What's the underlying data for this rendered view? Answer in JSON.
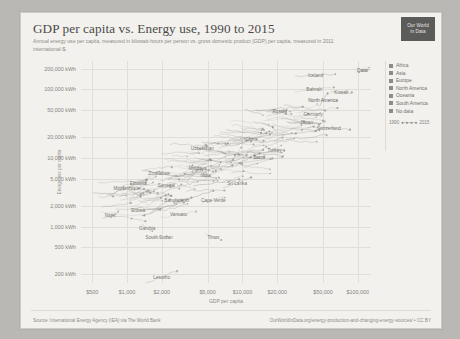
{
  "header": {
    "title": "GDP per capita vs. Energy use, 1990 to 2015",
    "subtitle": "Annual energy use per capita, measured in kilowatt-hours per person vs. gross domestic product (GDP) per capita, measured in 2011 international-$.",
    "logo_line1": "Our World",
    "logo_line2": "in Data"
  },
  "footer": {
    "source": "Source: International Energy Agency (IEA) via The World Bank",
    "link": "OurWorldInData.org/energy-production-and-changing-energy-sources/ • CC BY"
  },
  "legend": {
    "entries": [
      {
        "label": "Africa",
        "color": "#8c8c8a"
      },
      {
        "label": "Asia",
        "color": "#8c8c8a"
      },
      {
        "label": "Europe",
        "color": "#8c8c8a"
      },
      {
        "label": "North America",
        "color": "#8c8c8a"
      },
      {
        "label": "Oceania",
        "color": "#8c8c8a"
      },
      {
        "label": "South America",
        "color": "#8c8c8a"
      },
      {
        "label": "No data",
        "color": "#8c8c8a"
      }
    ],
    "timeline_start": "1990",
    "timeline_end": "2015",
    "timeline_dots": "●–●–●–●"
  },
  "chart_data": {
    "type": "scatter",
    "title": "GDP per capita vs. Energy use, 1990 to 2015",
    "subtitle": "Annual energy use per capita, measured in kilowatt-hours per person vs. gross domestic product (GDP) per capita, measured in 2011 international-$.",
    "xlabel": "GDP per capita",
    "ylabel": "Energy use per capita",
    "xscale": "log",
    "yscale": "log",
    "xlim": [
      400,
      130000
    ],
    "ylim": [
      150,
      260000
    ],
    "grid": true,
    "legend_position": "right",
    "xticks": [
      {
        "value": 500,
        "label": "$500"
      },
      {
        "value": 1000,
        "label": "$1,000"
      },
      {
        "value": 2000,
        "label": "$2,000"
      },
      {
        "value": 5000,
        "label": "$5,000"
      },
      {
        "value": 10000,
        "label": "$10,000"
      },
      {
        "value": 20000,
        "label": "$20,000"
      },
      {
        "value": 50000,
        "label": "$50,000"
      },
      {
        "value": 100000,
        "label": "$100,000"
      }
    ],
    "yticks": [
      {
        "value": 200000,
        "label": "200,000 kWh"
      },
      {
        "value": 100000,
        "label": "100,000 kWh"
      },
      {
        "value": 50000,
        "label": "50,000 kWh"
      },
      {
        "value": 20000,
        "label": "20,000 kWh"
      },
      {
        "value": 10000,
        "label": "10,000 kWh"
      },
      {
        "value": 5000,
        "label": "5,000 kWh"
      },
      {
        "value": 2000,
        "label": "2,000 kWh"
      },
      {
        "value": 1000,
        "label": "1,000 kWh"
      },
      {
        "value": 500,
        "label": "500 kWh"
      },
      {
        "value": 200,
        "label": "200 kWh"
      }
    ],
    "annotations": [
      {
        "label": "Qatar",
        "x": 110000,
        "y": 190000
      },
      {
        "label": "Iceland",
        "x": 43000,
        "y": 160000
      },
      {
        "label": "Bahrain",
        "x": 42000,
        "y": 100000
      },
      {
        "label": "Kuwait",
        "x": 72000,
        "y": 92000
      },
      {
        "label": "North America",
        "x": 50000,
        "y": 70000
      },
      {
        "label": "Russia",
        "x": 21000,
        "y": 48000
      },
      {
        "label": "Germany",
        "x": 41000,
        "y": 44000
      },
      {
        "label": "Japan",
        "x": 36000,
        "y": 33000
      },
      {
        "label": "Switzerland",
        "x": 56000,
        "y": 27000
      },
      {
        "label": "China",
        "x": 12000,
        "y": 19000
      },
      {
        "label": "Turkey",
        "x": 19000,
        "y": 13000
      },
      {
        "label": "Uzbekistan",
        "x": 4500,
        "y": 14000
      },
      {
        "label": "Brazil",
        "x": 14000,
        "y": 10500
      },
      {
        "label": "Moldova",
        "x": 4100,
        "y": 7200
      },
      {
        "label": "India",
        "x": 4800,
        "y": 5600
      },
      {
        "label": "Sri Lanka",
        "x": 9000,
        "y": 4300
      },
      {
        "label": "Zimbabwe",
        "x": 1900,
        "y": 6000
      },
      {
        "label": "Ethiopia",
        "x": 1250,
        "y": 4300
      },
      {
        "label": "Senegal",
        "x": 2200,
        "y": 4100
      },
      {
        "label": "Mozambique",
        "x": 1000,
        "y": 3600
      },
      {
        "label": "Bangladesh",
        "x": 2700,
        "y": 2400
      },
      {
        "label": "Cape Verde",
        "x": 5600,
        "y": 2400
      },
      {
        "label": "Eritrea",
        "x": 1250,
        "y": 1750
      },
      {
        "label": "Vanuatu",
        "x": 2800,
        "y": 1500
      },
      {
        "label": "Niger",
        "x": 720,
        "y": 1450
      },
      {
        "label": "Gambia",
        "x": 1500,
        "y": 950
      },
      {
        "label": "South Sudan",
        "x": 1900,
        "y": 700
      },
      {
        "label": "Timor",
        "x": 5600,
        "y": 700
      },
      {
        "label": "Lesotho",
        "x": 2000,
        "y": 185
      }
    ]
  }
}
